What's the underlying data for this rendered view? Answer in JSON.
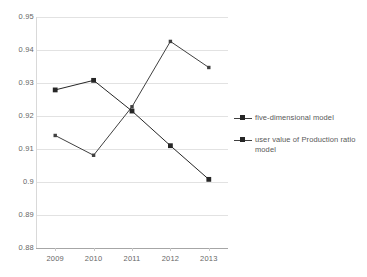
{
  "chart_data": {
    "type": "line",
    "title": "",
    "xlabel": "",
    "ylabel": "",
    "categories": [
      "2009",
      "2010",
      "2011",
      "2012",
      "2013"
    ],
    "ylim": [
      0.88,
      0.95
    ],
    "ytick_labels": [
      "0.95",
      "0.94",
      "0.93",
      "0.92",
      "0.91",
      "0.9",
      "0.89",
      "0.88"
    ],
    "ytick_values": [
      0.95,
      0.94,
      0.93,
      0.92,
      0.91,
      0.9,
      0.89,
      0.88
    ],
    "grid": true,
    "legend_position": "right",
    "series": [
      {
        "name": "five-dimensional model",
        "marker": "dot",
        "color": "#404040",
        "values": [
          0.9141,
          0.9081,
          0.9228,
          0.9426,
          0.9347
        ]
      },
      {
        "name": "user value of Production ratio model",
        "marker": "square",
        "color": "#262626",
        "values": [
          0.9279,
          0.9308,
          0.9215,
          0.911,
          0.9008
        ]
      }
    ]
  },
  "legend": {
    "entries": [
      {
        "label": "five-dimensional model"
      },
      {
        "label": "user value of Production ratio model"
      }
    ]
  }
}
